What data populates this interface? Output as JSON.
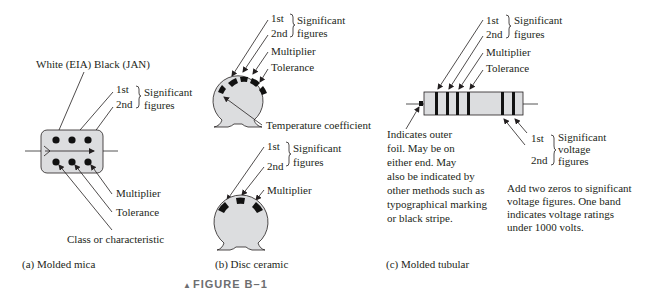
{
  "figure": {
    "caption": "FIGURE B–1",
    "caption_marker": "▲"
  },
  "panels": {
    "molded_mica": {
      "caption": "(a) Molded mica",
      "top_label": "White (EIA) Black (JAN)",
      "first": "1st",
      "second": "2nd",
      "significant": "Significant",
      "figures": "figures",
      "multiplier": "Multiplier",
      "tolerance": "Tolerance",
      "class": "Class or characteristic"
    },
    "disc_ceramic": {
      "caption": "(b) Disc ceramic",
      "top": {
        "first": "1st",
        "second": "2nd",
        "significant": "Significant",
        "figures": "figures",
        "multiplier": "Multiplier",
        "tolerance": "Tolerance",
        "temp_coeff": "Temperature coefficient"
      },
      "bottom": {
        "first": "1st",
        "second": "2nd",
        "significant": "Significant",
        "figures": "figures",
        "multiplier": "Multiplier"
      }
    },
    "molded_tubular": {
      "caption": "(c) Molded tubular",
      "first": "1st",
      "second": "2nd",
      "significant": "Significant",
      "figures": "figures",
      "multiplier": "Multiplier",
      "tolerance": "Tolerance",
      "foil_note": [
        "Indicates outer",
        "foil.  May be on",
        "either end.  May",
        "also be indicated by",
        "other methods such as",
        "typographical marking",
        "or black stripe."
      ],
      "voltage": {
        "first": "1st",
        "second": "2nd",
        "significant": "Significant",
        "voltage": "voltage",
        "figures": "figures"
      },
      "voltage_note": [
        "Add two zeros to significant",
        "voltage figures.  One band",
        "indicates voltage ratings",
        "under 1000 volts."
      ]
    }
  }
}
